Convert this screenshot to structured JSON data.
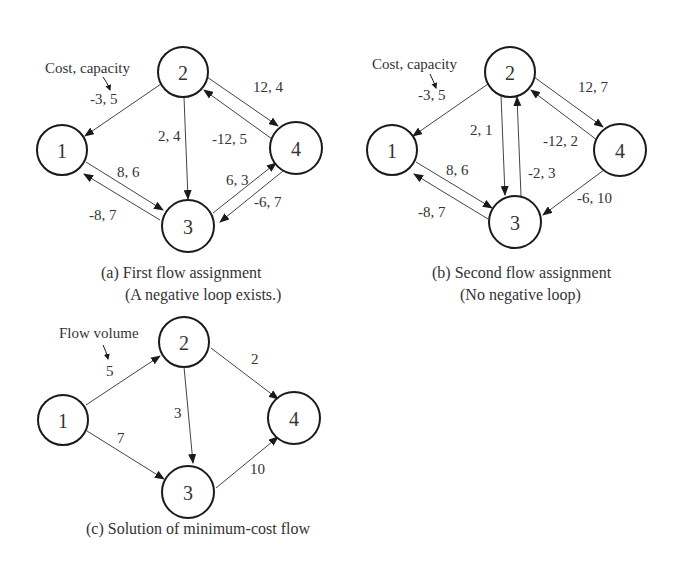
{
  "diagrams": [
    {
      "id": "a",
      "caption_line1": "(a) First flow assignment",
      "caption_line2": "(A negative loop exists.)",
      "annotation": "Cost, capacity",
      "nodes": [
        {
          "id": "1",
          "label": "1",
          "x": 62,
          "y": 150
        },
        {
          "id": "2",
          "label": "2",
          "x": 183,
          "y": 72
        },
        {
          "id": "3",
          "label": "3",
          "x": 188,
          "y": 226
        },
        {
          "id": "4",
          "label": "4",
          "x": 296,
          "y": 148
        }
      ],
      "edges": [
        {
          "from": "2",
          "to": "1",
          "label": "-3, 5"
        },
        {
          "from": "2",
          "to": "3",
          "label": "2, 4"
        },
        {
          "from": "2",
          "to": "4",
          "label": "12,  4"
        },
        {
          "from": "4",
          "to": "2",
          "label": "-12,  5"
        },
        {
          "from": "1",
          "to": "3",
          "label": "8, 6"
        },
        {
          "from": "3",
          "to": "1",
          "label": "-8, 7"
        },
        {
          "from": "3",
          "to": "4",
          "label": "6, 3"
        },
        {
          "from": "4",
          "to": "3",
          "label": "-6, 7"
        }
      ]
    },
    {
      "id": "b",
      "caption_line1": "(b) Second flow assignment",
      "caption_line2": "(No negative loop)",
      "annotation": "Cost, capacity",
      "nodes": [
        {
          "id": "1",
          "label": "1",
          "x": 392,
          "y": 150
        },
        {
          "id": "2",
          "label": "2",
          "x": 510,
          "y": 72
        },
        {
          "id": "3",
          "label": "3",
          "x": 515,
          "y": 222
        },
        {
          "id": "4",
          "label": "4",
          "x": 620,
          "y": 150
        }
      ],
      "edges": [
        {
          "from": "2",
          "to": "1",
          "label": "-3, 5"
        },
        {
          "from": "2",
          "to": "3",
          "label": "2, 1"
        },
        {
          "from": "3",
          "to": "2",
          "label": "-2, 3"
        },
        {
          "from": "2",
          "to": "4",
          "label": "12,  7"
        },
        {
          "from": "4",
          "to": "2",
          "label": "-12,  2"
        },
        {
          "from": "1",
          "to": "3",
          "label": "8, 6"
        },
        {
          "from": "3",
          "to": "1",
          "label": "-8, 7"
        },
        {
          "from": "4",
          "to": "3",
          "label": "-6, 10"
        }
      ]
    },
    {
      "id": "c",
      "caption_line1": "(c) Solution of minimum-cost flow",
      "annotation": "Flow volume",
      "nodes": [
        {
          "id": "1",
          "label": "1",
          "x": 63,
          "y": 420
        },
        {
          "id": "2",
          "label": "2",
          "x": 184,
          "y": 342
        },
        {
          "id": "3",
          "label": "3",
          "x": 188,
          "y": 492
        },
        {
          "id": "4",
          "label": "4",
          "x": 294,
          "y": 418
        }
      ],
      "edges": [
        {
          "from": "1",
          "to": "2",
          "label": "5"
        },
        {
          "from": "1",
          "to": "3",
          "label": "7"
        },
        {
          "from": "2",
          "to": "3",
          "label": "3"
        },
        {
          "from": "2",
          "to": "4",
          "label": "2"
        },
        {
          "from": "3",
          "to": "4",
          "label": "10"
        }
      ]
    }
  ]
}
